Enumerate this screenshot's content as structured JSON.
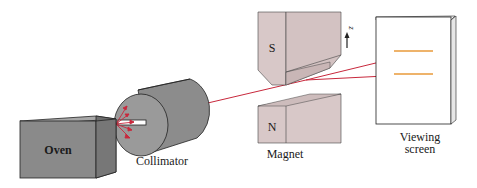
{
  "diagram": {
    "type": "Stern-Gerlach apparatus",
    "components": {
      "oven": {
        "label": "Oven"
      },
      "collimator": {
        "label": "Collimator"
      },
      "magnet": {
        "label": "Magnet",
        "top_pole": "S",
        "bottom_pole": "N",
        "axis_label": "z"
      },
      "screen": {
        "label_line1": "Viewing",
        "label_line2": "screen"
      }
    },
    "colors": {
      "oven_face": "#8a8a8a",
      "oven_top": "#a8a8a8",
      "oven_side": "#6e6e6e",
      "collimator": "#9a9a9a",
      "magnet": "#d8c8c8",
      "magnet_shade": "#c9b6b6",
      "beam": "#c8283c",
      "spot": "#e89a3a",
      "outline": "#222222"
    }
  }
}
